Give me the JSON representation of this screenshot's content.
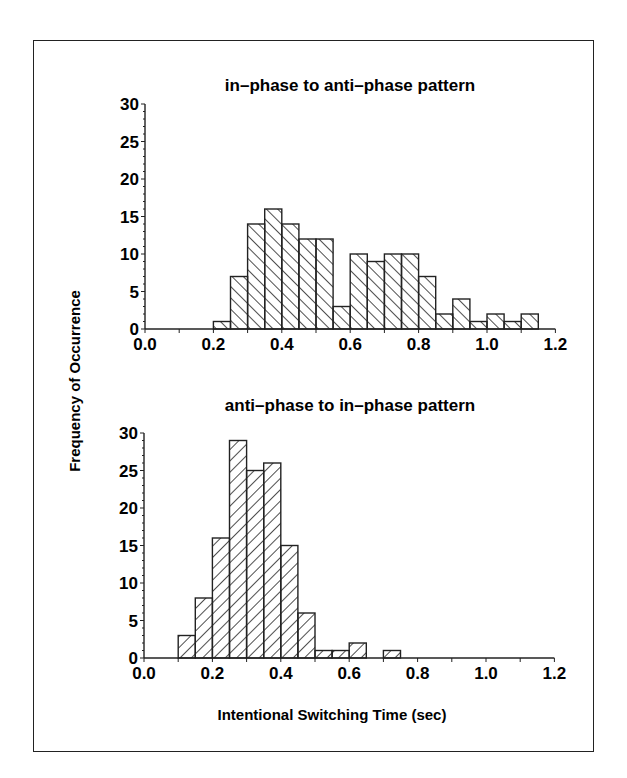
{
  "figure": {
    "ylabel": "Frequency of Occurrence",
    "xlabel": "Intentional Switching Time (sec)"
  },
  "chart_data": [
    {
      "type": "bar",
      "subtype": "histogram",
      "title": "in–phase to anti–phase pattern",
      "xlabel": "Intentional Switching Time (sec)",
      "ylabel": "Frequency of Occurrence",
      "xlim": [
        0.0,
        1.2
      ],
      "ylim": [
        0,
        30
      ],
      "xticks": [
        "0.0",
        "0.2",
        "0.4",
        "0.6",
        "0.8",
        "1.0",
        "1.2"
      ],
      "yticks": [
        "0",
        "5",
        "10",
        "15",
        "20",
        "25",
        "30"
      ],
      "bin_width": 0.05,
      "hatch": "backslash",
      "grid": false,
      "bins": [
        {
          "start": 0.2,
          "count": 1
        },
        {
          "start": 0.25,
          "count": 7
        },
        {
          "start": 0.3,
          "count": 14
        },
        {
          "start": 0.35,
          "count": 16
        },
        {
          "start": 0.4,
          "count": 14
        },
        {
          "start": 0.45,
          "count": 12
        },
        {
          "start": 0.5,
          "count": 12
        },
        {
          "start": 0.55,
          "count": 3
        },
        {
          "start": 0.6,
          "count": 10
        },
        {
          "start": 0.65,
          "count": 9
        },
        {
          "start": 0.7,
          "count": 10
        },
        {
          "start": 0.75,
          "count": 10
        },
        {
          "start": 0.8,
          "count": 7
        },
        {
          "start": 0.85,
          "count": 2
        },
        {
          "start": 0.9,
          "count": 4
        },
        {
          "start": 0.95,
          "count": 1
        },
        {
          "start": 1.0,
          "count": 2
        },
        {
          "start": 1.05,
          "count": 1
        },
        {
          "start": 1.1,
          "count": 2
        }
      ]
    },
    {
      "type": "bar",
      "subtype": "histogram",
      "title": "anti–phase to in–phase pattern",
      "xlabel": "Intentional Switching Time (sec)",
      "ylabel": "Frequency of Occurrence",
      "xlim": [
        0.0,
        1.2
      ],
      "ylim": [
        0,
        30
      ],
      "xticks": [
        "0.0",
        "0.2",
        "0.4",
        "0.6",
        "0.8",
        "1.0",
        "1.2"
      ],
      "yticks": [
        "0",
        "5",
        "10",
        "15",
        "20",
        "25",
        "30"
      ],
      "bin_width": 0.05,
      "hatch": "slash",
      "grid": false,
      "bins": [
        {
          "start": 0.1,
          "count": 3
        },
        {
          "start": 0.15,
          "count": 8
        },
        {
          "start": 0.2,
          "count": 16
        },
        {
          "start": 0.25,
          "count": 29
        },
        {
          "start": 0.3,
          "count": 25
        },
        {
          "start": 0.35,
          "count": 26
        },
        {
          "start": 0.4,
          "count": 15
        },
        {
          "start": 0.45,
          "count": 6
        },
        {
          "start": 0.5,
          "count": 1
        },
        {
          "start": 0.55,
          "count": 1
        },
        {
          "start": 0.6,
          "count": 2
        },
        {
          "start": 0.7,
          "count": 1
        }
      ]
    }
  ]
}
